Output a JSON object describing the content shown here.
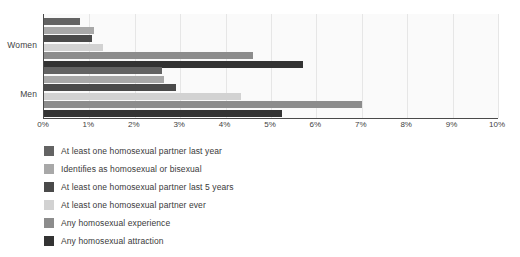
{
  "chart_data": {
    "type": "bar",
    "orientation": "horizontal",
    "title": "",
    "subtitle": "",
    "xlabel": "",
    "ylabel": "",
    "xlim": [
      0,
      10
    ],
    "xtick_labels": [
      "0%",
      "1%",
      "2%",
      "3%",
      "4%",
      "5%",
      "6%",
      "7%",
      "8%",
      "9%",
      "10%"
    ],
    "xtick_values": [
      0,
      1,
      2,
      3,
      4,
      5,
      6,
      7,
      8,
      9,
      10
    ],
    "grid": true,
    "grid_axis": "x",
    "legend_position": "below",
    "categories": [
      "Women",
      "Men"
    ],
    "units": "percent",
    "series": [
      {
        "name": "At least one homosexual partner last year",
        "color": "#636363",
        "values": [
          0.8,
          2.6
        ]
      },
      {
        "name": "Identifies as homosexual or bisexual",
        "color": "#a8a8a8",
        "values": [
          1.1,
          2.65
        ]
      },
      {
        "name": "At  least one homosexual partner last 5 years",
        "color": "#4a4a4a",
        "values": [
          1.05,
          2.9
        ]
      },
      {
        "name": "At least one homosexual partner ever",
        "color": "#d2d2d2",
        "values": [
          1.3,
          4.35
        ]
      },
      {
        "name": "Any homosexual experience",
        "color": "#8c8c8c",
        "values": [
          4.6,
          7.0
        ]
      },
      {
        "name": "Any homosexual attraction",
        "color": "#333333",
        "values": [
          5.7,
          5.25
        ]
      }
    ]
  },
  "axis": {
    "group_labels": [
      "Women",
      "Men"
    ]
  },
  "colors": {
    "plot_background": "#fafafa",
    "axis_line": "#4a4a4a",
    "gridline": "#e6e6e6",
    "text": "#3a3a3a"
  }
}
